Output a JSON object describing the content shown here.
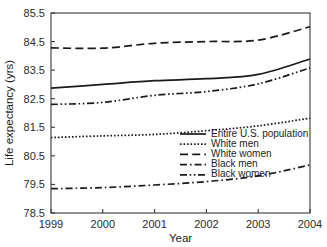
{
  "chart_data": {
    "type": "line",
    "title": "",
    "xlabel": "Year",
    "ylabel": "Life expectancy (yrs)",
    "x": [
      1999,
      2000,
      2001,
      2002,
      2003,
      2004
    ],
    "xticklabels": [
      "1999",
      "2000",
      "2001",
      "2002",
      "2003",
      "2004"
    ],
    "xlim": [
      1999,
      2004
    ],
    "ylim": [
      78.5,
      85.5
    ],
    "yticks": [
      78.5,
      79.5,
      80.5,
      81.5,
      82.5,
      83.5,
      84.5,
      85.5
    ],
    "yticklabels": [
      "78.5",
      "79.5",
      "80.5",
      "81.5",
      "82.5",
      "83.5",
      "84.5",
      "85.5"
    ],
    "grid": false,
    "legend_position": "center-right",
    "series": [
      {
        "name": "Entire U.S. population",
        "dash": "solid",
        "values": [
          82.87,
          83.0,
          83.13,
          83.2,
          83.35,
          83.89
        ]
      },
      {
        "name": "White men",
        "dash": "dotted",
        "values": [
          81.14,
          81.2,
          81.25,
          81.38,
          81.55,
          81.82
        ]
      },
      {
        "name": "White women",
        "dash": "long-dash",
        "values": [
          84.28,
          84.27,
          84.44,
          84.5,
          84.55,
          85.02
        ]
      },
      {
        "name": "Black men",
        "dash": "dash-dot",
        "values": [
          79.35,
          79.39,
          79.48,
          79.6,
          79.8,
          80.18
        ]
      },
      {
        "name": "Black women",
        "dash": "dash-dot-dot",
        "values": [
          82.3,
          82.37,
          82.62,
          82.75,
          83.02,
          83.58
        ]
      }
    ]
  }
}
